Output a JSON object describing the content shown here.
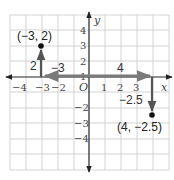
{
  "diagram": {
    "type": "coordinate-plane",
    "x_axis_label": "x",
    "y_axis_label": "y",
    "origin_label": "O",
    "x_ticks": [
      "−4",
      "−3",
      "−2",
      "1",
      "2",
      "3"
    ],
    "y_ticks": [
      "4",
      "3",
      "2",
      "1",
      "−2",
      "−3",
      "−4"
    ],
    "points": [
      {
        "label": "(−3, 2)",
        "x": -3,
        "y": 2
      },
      {
        "label": "(4, −2.5)",
        "x": 4,
        "y": -2.5
      }
    ],
    "vectors": [
      {
        "label": "2",
        "from": [
          -3,
          0
        ],
        "to": [
          -3,
          2
        ],
        "direction": "up"
      },
      {
        "label": "−3",
        "from": [
          0,
          0
        ],
        "to": [
          -3,
          0
        ],
        "direction": "left"
      },
      {
        "label": "4",
        "from": [
          0,
          0
        ],
        "to": [
          4,
          0
        ],
        "direction": "right"
      },
      {
        "label": "−2.5",
        "from": [
          4,
          0
        ],
        "to": [
          4,
          -2.5
        ],
        "direction": "down"
      }
    ],
    "colors": {
      "grid": "#c8c8c8",
      "axis": "#222222",
      "vector": "#555555",
      "vector_light": "#7a7a7a",
      "point": "#111111"
    }
  }
}
